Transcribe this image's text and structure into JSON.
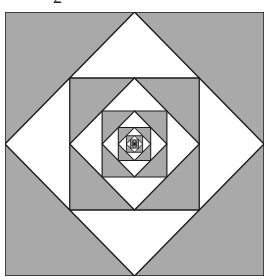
{
  "figure": {
    "label": "2",
    "fill_gray": "#a9a9a9",
    "fill_white": "#ffffff",
    "stroke": "#1a1a1a",
    "levels": 8
  }
}
